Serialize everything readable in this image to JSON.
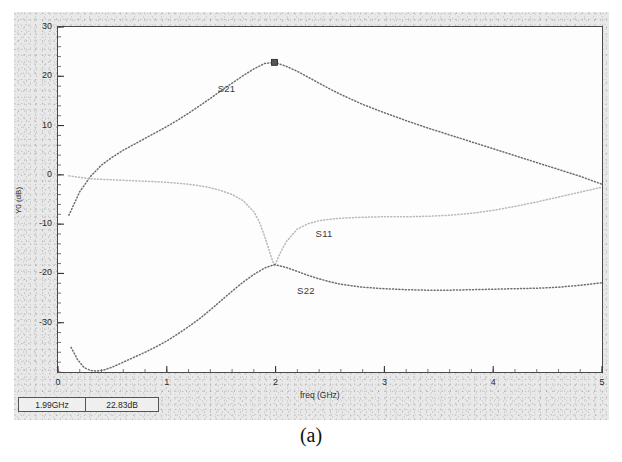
{
  "figure": {
    "caption": "(a)"
  },
  "readout": {
    "freq": "1.99GHz",
    "magnitude": "22.83dB"
  },
  "chart_data": {
    "type": "line",
    "title": "",
    "xlabel": "freq (GHz)",
    "ylabel": "Y0 (dB)",
    "xlim": [
      0,
      5
    ],
    "ylim": [
      -40,
      30
    ],
    "xticks": [
      0,
      1,
      2,
      3,
      4,
      5
    ],
    "xtick_labels": [
      "0",
      "1",
      "2",
      "3",
      "4",
      "5"
    ],
    "yticks": [
      30,
      20,
      10,
      0,
      -10,
      -20,
      -30
    ],
    "ytick_labels": [
      "30",
      "20",
      "10",
      "0",
      "-10",
      "-20",
      "-30"
    ],
    "grid": false,
    "legend_position": "inline-annotations",
    "marker": {
      "series": "S21",
      "x": 1.99,
      "y": 22.83,
      "label_freq": "1.99GHz",
      "label_value": "22.83dB",
      "shape": "square"
    },
    "annotations": [
      {
        "text": "S21",
        "x": 1.55,
        "y": 17.5
      },
      {
        "text": "S11",
        "x": 2.45,
        "y": -12.0
      },
      {
        "text": "S22",
        "x": 2.28,
        "y": -23.5
      }
    ],
    "series": [
      {
        "name": "S21",
        "color": "#6d6d6d",
        "style": "dotted",
        "x": [
          0.1,
          0.2,
          0.3,
          0.4,
          0.5,
          0.6,
          0.7,
          0.8,
          0.9,
          1.0,
          1.1,
          1.2,
          1.3,
          1.4,
          1.5,
          1.6,
          1.7,
          1.8,
          1.9,
          1.99,
          2.1,
          2.2,
          2.3,
          2.4,
          2.5,
          2.6,
          2.8,
          3.0,
          3.2,
          3.4,
          3.6,
          3.8,
          4.0,
          4.2,
          4.4,
          4.6,
          4.8,
          5.0
        ],
        "y": [
          -8.2,
          -3.4,
          -0.3,
          2.0,
          3.6,
          5.0,
          6.2,
          7.4,
          8.6,
          9.8,
          11.1,
          12.5,
          14.0,
          15.5,
          17.1,
          18.6,
          20.1,
          21.5,
          22.6,
          22.83,
          22.0,
          21.0,
          19.8,
          18.6,
          17.4,
          16.3,
          14.3,
          12.6,
          11.0,
          9.5,
          8.1,
          6.7,
          5.3,
          3.9,
          2.5,
          1.1,
          -0.3,
          -1.9
        ]
      },
      {
        "name": "S11",
        "color": "#b9b9b9",
        "style": "dotted",
        "x": [
          0.1,
          0.2,
          0.3,
          0.4,
          0.5,
          0.6,
          0.7,
          0.8,
          0.9,
          1.0,
          1.1,
          1.2,
          1.3,
          1.4,
          1.5,
          1.6,
          1.7,
          1.8,
          1.85,
          1.9,
          1.95,
          1.99,
          2.05,
          2.1,
          2.2,
          2.3,
          2.4,
          2.5,
          2.6,
          2.8,
          3.0,
          3.2,
          3.4,
          3.6,
          3.8,
          4.0,
          4.2,
          4.4,
          4.6,
          4.8,
          5.0
        ],
        "y": [
          -0.2,
          -0.5,
          -0.8,
          -0.9,
          -1.0,
          -1.1,
          -1.2,
          -1.3,
          -1.4,
          -1.5,
          -1.7,
          -1.9,
          -2.2,
          -2.6,
          -3.2,
          -4.0,
          -5.2,
          -7.5,
          -9.5,
          -12.5,
          -16.0,
          -18.5,
          -15.5,
          -13.5,
          -11.0,
          -9.9,
          -9.3,
          -9.0,
          -8.8,
          -8.6,
          -8.5,
          -8.5,
          -8.4,
          -8.2,
          -7.8,
          -7.2,
          -6.4,
          -5.5,
          -4.5,
          -3.5,
          -2.5
        ]
      },
      {
        "name": "S22",
        "color": "#6d6d6d",
        "style": "dotted",
        "x": [
          0.12,
          0.18,
          0.24,
          0.3,
          0.36,
          0.42,
          0.5,
          0.6,
          0.7,
          0.8,
          0.9,
          1.0,
          1.1,
          1.2,
          1.3,
          1.4,
          1.5,
          1.6,
          1.7,
          1.8,
          1.9,
          1.99,
          2.1,
          2.2,
          2.3,
          2.4,
          2.5,
          2.6,
          2.8,
          3.0,
          3.2,
          3.4,
          3.6,
          3.8,
          4.0,
          4.2,
          4.4,
          4.6,
          4.8,
          5.0
        ],
        "y": [
          -35.0,
          -37.5,
          -39.1,
          -39.7,
          -39.8,
          -39.6,
          -39.0,
          -38.0,
          -37.0,
          -36.0,
          -34.9,
          -33.7,
          -32.3,
          -30.8,
          -29.2,
          -27.4,
          -25.5,
          -23.6,
          -21.8,
          -20.2,
          -18.9,
          -18.2,
          -18.8,
          -19.6,
          -20.4,
          -21.1,
          -21.7,
          -22.2,
          -22.8,
          -23.1,
          -23.3,
          -23.4,
          -23.4,
          -23.3,
          -23.2,
          -23.1,
          -23.0,
          -22.8,
          -22.4,
          -21.9
        ]
      }
    ]
  }
}
